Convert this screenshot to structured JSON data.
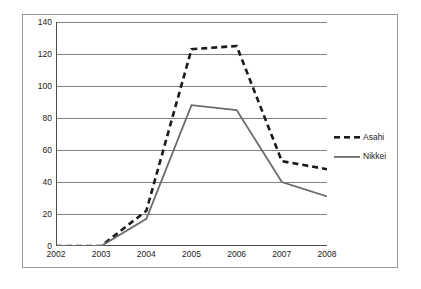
{
  "chart_data": {
    "type": "line",
    "title": "",
    "subtitle": "",
    "xlabel": "",
    "ylabel": "",
    "x": [
      2002,
      2003,
      2004,
      2005,
      2006,
      2007,
      2008
    ],
    "xtick_labels": [
      "2002",
      "2003",
      "2004",
      "2005",
      "2006",
      "2007",
      "2008"
    ],
    "ytick_labels": [
      "0",
      "20",
      "40",
      "60",
      "80",
      "100",
      "120",
      "140"
    ],
    "ytick_values": [
      0,
      20,
      40,
      60,
      80,
      100,
      120,
      140
    ],
    "xlim": [
      2002,
      2008
    ],
    "ylim": [
      0,
      140
    ],
    "grid": "horizontal",
    "legend_position": "right",
    "series": [
      {
        "name": "Asahi",
        "style": "dashed",
        "color": "#1a1a1a",
        "values": [
          0,
          0,
          22,
          123,
          125,
          53,
          48
        ]
      },
      {
        "name": "Nikkei",
        "style": "solid",
        "color": "#6b6b6b",
        "values": [
          0,
          0,
          17,
          88,
          85,
          40,
          31
        ]
      }
    ]
  },
  "legend": {
    "items": [
      {
        "label": "Asahi"
      },
      {
        "label": "Nikkei"
      }
    ]
  },
  "colors": {
    "asahi": "#1a1a1a",
    "nikkei": "#6b6b6b",
    "gridline": "#808080",
    "axis": "#4d4d4d",
    "frame": "#9a9a9a",
    "text": "#1c1c1c",
    "background": "#ffffff"
  }
}
